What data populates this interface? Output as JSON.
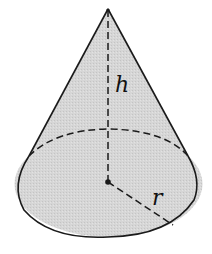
{
  "diagram": {
    "shape": "right circular cone",
    "labels": {
      "height": "h",
      "radius": "r"
    },
    "colors": {
      "fill": "#d4d4d4",
      "stroke": "#1a1a1a",
      "background": "#ffffff"
    }
  }
}
